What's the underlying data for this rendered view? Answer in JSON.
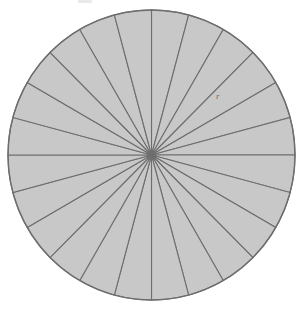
{
  "figure": {
    "label_radius": "r",
    "colors": {
      "background": "#ffffff",
      "sector_fill": "#c8c8c8",
      "sector_stroke": "#6e6e6e",
      "circle_outline": "#6e6e6e",
      "label_text": "#6e6e6e"
    }
  },
  "chart_data": {
    "type": "pie",
    "xlabel": "",
    "ylabel": "",
    "sector_count": 24,
    "sector_angle_degrees": 15,
    "equal_slices": true,
    "categories": [
      "1",
      "2",
      "3",
      "4",
      "5",
      "6",
      "7",
      "8",
      "9",
      "10",
      "11",
      "12",
      "13",
      "14",
      "15",
      "16",
      "17",
      "18",
      "19",
      "20",
      "21",
      "22",
      "23",
      "24"
    ],
    "values": [
      15,
      15,
      15,
      15,
      15,
      15,
      15,
      15,
      15,
      15,
      15,
      15,
      15,
      15,
      15,
      15,
      15,
      15,
      15,
      15,
      15,
      15,
      15,
      15
    ],
    "annotations": [
      {
        "text": "r",
        "meaning": "radius",
        "x": 219,
        "y": 97
      }
    ],
    "geometry": {
      "center_x": 151.5,
      "center_y": 155,
      "radius_x": 143.5,
      "radius_y": 145,
      "start_angle_degrees": -90
    },
    "legend": "none",
    "grid": false
  }
}
